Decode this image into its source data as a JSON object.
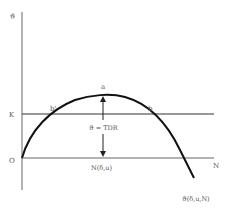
{
  "diagram": {
    "type": "economic-curve",
    "y_axis_label": "ϑ",
    "x_axis_label": "N",
    "origin_label": "O",
    "k_line_label": "K",
    "curve_label": "ϑ(δ,u,N)",
    "peak_label": "a",
    "left_intersection_label": "b'",
    "right_intersection_label": "b",
    "arrow_label": "ϑ = TDR",
    "peak_x_label": "N(δ,u)",
    "colors": {
      "ink": "#111111",
      "axis": "#555555",
      "text": "#555555"
    }
  }
}
